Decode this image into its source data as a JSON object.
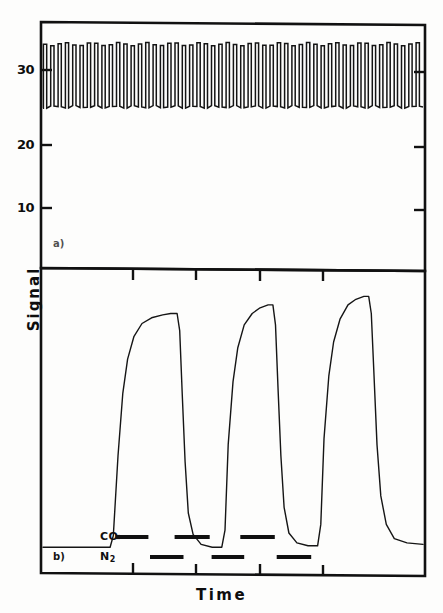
{
  "figure": {
    "axis_x_title": "Time",
    "axis_y_title": "Signal",
    "panel_a_label": "a)",
    "panel_b_label": "b)",
    "gas_co_label": "CO",
    "gas_n2_label": "N",
    "gas_n2_sub": "2",
    "ink_color": "#111111",
    "background_color": "#ffffff"
  },
  "chart_data": [
    {
      "type": "line",
      "panel": "a)",
      "title": "",
      "xlabel": "",
      "ylabel": "Signal",
      "grid": false,
      "legend": "none",
      "ylim": [
        0,
        38
      ],
      "yticks": [
        10,
        20,
        30
      ],
      "ytick_labels": [
        "10",
        "20",
        "30"
      ],
      "xlim": [
        0,
        100
      ],
      "xticks": [
        24,
        40,
        57,
        73
      ],
      "xtick_labels": [
        "",
        "",
        "",
        ""
      ],
      "description": "Dense square-wave oscillation of the signal between a low level of about 25 and a high level of about 35, repeating across the full time axis.",
      "series": [
        {
          "name": "oscillating signal",
          "waveform": "square",
          "cycles": 52,
          "low_value": 25.2,
          "high_value": 35.0,
          "duty_cycle": 0.45
        }
      ]
    },
    {
      "type": "line",
      "panel": "b)",
      "title": "",
      "xlabel": "Time",
      "ylabel": "Signal",
      "grid": false,
      "legend": "none",
      "ylim": [
        0,
        100
      ],
      "yticks": [],
      "ytick_labels": [],
      "xlim": [
        0,
        100
      ],
      "xticks": [
        24,
        40,
        57,
        73
      ],
      "xtick_labels": [
        "",
        "",
        "",
        ""
      ],
      "description": "Three broad rectangular response pulses with sigmoidal rising edges and steep falling edges, produced by alternating CO and N2 gas exposure.",
      "series": [
        {
          "name": "signal response",
          "points": [
            [
              0.0,
              8.0
            ],
            [
              21.0,
              8.0
            ],
            [
              22.0,
              12.0
            ],
            [
              23.5,
              40.0
            ],
            [
              25.0,
              62.0
            ],
            [
              26.5,
              74.0
            ],
            [
              28.5,
              82.0
            ],
            [
              31.0,
              86.5
            ],
            [
              34.0,
              88.5
            ],
            [
              37.5,
              89.5
            ],
            [
              40.0,
              90.0
            ],
            [
              42.0,
              90.0
            ],
            [
              42.8,
              84.0
            ],
            [
              43.6,
              62.0
            ],
            [
              44.5,
              38.0
            ],
            [
              45.5,
              20.0
            ],
            [
              47.0,
              12.5
            ],
            [
              49.5,
              9.0
            ],
            [
              53.0,
              8.0
            ],
            [
              56.0,
              8.0
            ],
            [
              57.0,
              14.0
            ],
            [
              58.0,
              44.0
            ],
            [
              59.5,
              66.0
            ],
            [
              61.0,
              78.0
            ],
            [
              63.0,
              86.0
            ],
            [
              65.5,
              90.0
            ],
            [
              68.0,
              92.0
            ],
            [
              70.5,
              93.0
            ],
            [
              72.0,
              93.0
            ],
            [
              72.8,
              86.0
            ],
            [
              73.6,
              64.0
            ],
            [
              74.5,
              40.0
            ],
            [
              75.5,
              22.0
            ],
            [
              77.0,
              13.0
            ],
            [
              79.5,
              9.5
            ],
            [
              83.0,
              8.5
            ],
            [
              86.0,
              8.5
            ],
            [
              87.0,
              16.0
            ],
            [
              88.0,
              46.0
            ],
            [
              89.5,
              68.0
            ],
            [
              91.0,
              80.0
            ],
            [
              93.0,
              88.0
            ],
            [
              95.5,
              93.0
            ],
            [
              98.0,
              95.0
            ],
            [
              100.5,
              96.0
            ],
            [
              102.0,
              96.0
            ],
            [
              102.8,
              90.0
            ],
            [
              103.6,
              70.0
            ],
            [
              104.6,
              44.0
            ],
            [
              105.8,
              26.0
            ],
            [
              107.5,
              16.0
            ],
            [
              110.0,
              11.0
            ],
            [
              114.0,
              9.5
            ],
            [
              119.0,
              9.0
            ]
          ]
        }
      ],
      "annotations": {
        "co_segments": [
          [
            22.8,
            33.0
          ],
          [
            41.2,
            52.2
          ],
          [
            61.8,
            72.6
          ]
        ],
        "n2_segments": [
          [
            33.5,
            44.0
          ],
          [
            52.8,
            63.0
          ],
          [
            73.2,
            84.0
          ]
        ]
      }
    }
  ]
}
